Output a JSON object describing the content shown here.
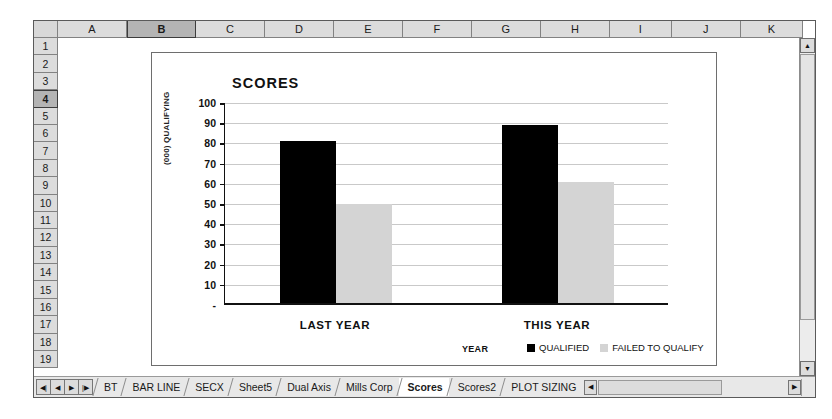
{
  "spreadsheet": {
    "columns": [
      "A",
      "B",
      "C",
      "D",
      "E",
      "F",
      "G",
      "H",
      "I",
      "J",
      "K"
    ],
    "selected_column": "B",
    "rows": [
      "1",
      "2",
      "3",
      "4",
      "5",
      "6",
      "7",
      "8",
      "9",
      "10",
      "11",
      "12",
      "13",
      "14",
      "15",
      "16",
      "17",
      "18",
      "19"
    ],
    "selected_row": "4",
    "sheet_tabs": [
      {
        "label": "BT",
        "active": false
      },
      {
        "label": "BAR LINE",
        "active": false
      },
      {
        "label": "SECX",
        "active": false
      },
      {
        "label": "Sheet5",
        "active": false
      },
      {
        "label": "Dual Axis",
        "active": false
      },
      {
        "label": "Mills Corp",
        "active": false
      },
      {
        "label": "Scores",
        "active": true
      },
      {
        "label": "Scores2",
        "active": false
      },
      {
        "label": "PLOT SIZING",
        "active": false
      }
    ],
    "nav_buttons": [
      {
        "name": "first-sheet",
        "glyph": "◀|"
      },
      {
        "name": "previous-sheet",
        "glyph": "◀"
      },
      {
        "name": "next-sheet",
        "glyph": "▶"
      },
      {
        "name": "last-sheet",
        "glyph": "|▶"
      }
    ],
    "scroll": {
      "up_glyph": "▲",
      "down_glyph": "▼",
      "left_glyph": "◀",
      "right_glyph": "▶"
    }
  },
  "chart_data": {
    "type": "bar",
    "title": "SCORES",
    "xlabel": "YEAR",
    "ylabel": "(000) QUALIFYING",
    "categories": [
      "LAST YEAR",
      "THIS YEAR"
    ],
    "series": [
      {
        "name": "QUALIFIED",
        "color": "#000000",
        "values": [
          80,
          88
        ]
      },
      {
        "name": "FAILED TO QUALIFY",
        "color": "#d4d4d4",
        "values": [
          49,
          60
        ]
      }
    ],
    "ylim": [
      0,
      100
    ],
    "yticks": [
      100,
      90,
      80,
      70,
      60,
      50,
      40,
      30,
      20,
      10
    ],
    "ytick_zero_label": "-",
    "grid": true,
    "legend_position": "bottom"
  }
}
